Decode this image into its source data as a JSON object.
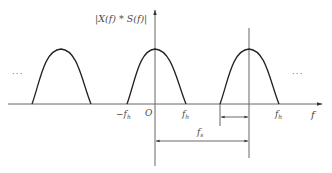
{
  "diagram": {
    "type": "sampled-spectrum",
    "y_axis_label": "|X(f) * S(f)|",
    "x_axis_label": "f",
    "origin_label": "O",
    "tick_labels": {
      "neg_fh": {
        "prefix": "−f",
        "sub": "h"
      },
      "fh": {
        "prefix": "f",
        "sub": "h"
      },
      "fh_right": {
        "prefix": "f",
        "sub": "h"
      },
      "fs": {
        "prefix": "f",
        "sub": "s"
      }
    },
    "ellipsis_left": "···",
    "ellipsis_right": "···",
    "pulses": [
      {
        "name": "left-replica",
        "start": 32,
        "peak": 61,
        "end": 91
      },
      {
        "name": "baseband",
        "start": 127,
        "peak": 155,
        "end": 186
      },
      {
        "name": "right-replica",
        "start": 220,
        "peak": 249,
        "end": 279
      }
    ],
    "colors": {
      "curve": "#222222",
      "axis": "#555555",
      "text": "#4a4a4a"
    }
  }
}
